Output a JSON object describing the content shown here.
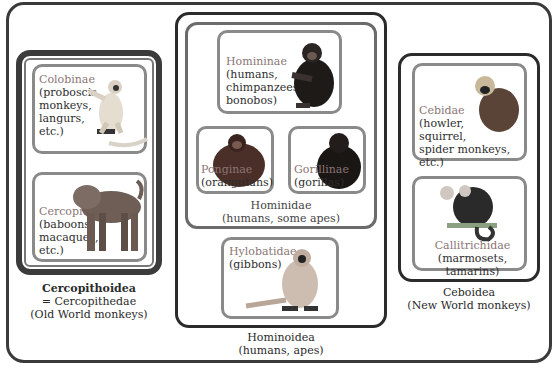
{
  "diagram": {
    "colors": {
      "outer_border": "#3a3a3a",
      "inner_border": "#8a8a8a",
      "taxon_name": "#8a7575",
      "text": "#2e2e2e"
    },
    "groups": [
      {
        "superfamily": "Cercopithoidea",
        "alias": "= Cercopithedae",
        "common": "(Old World monkeys)",
        "families": [
          {
            "name": "Colobinae",
            "lines": [
              "(proboscis",
              "monkeys,",
              "langurs,",
              "etc.)"
            ],
            "icon": "langur-icon"
          },
          {
            "name": "Cercopithecinae",
            "lines": [
              "(baboons,",
              "macaques,",
              "etc.)"
            ],
            "icon": "baboon-icon"
          }
        ]
      },
      {
        "superfamily": "Hominoidea",
        "common": "(humans, apes)",
        "family": {
          "name": "Hominidae",
          "common": "(humans, some apes)",
          "subfamilies": [
            {
              "name": "Homininae",
              "lines": [
                "(humans,",
                "chimpanzees,",
                "bonobos)"
              ],
              "icon": "chimpanzee-icon"
            },
            {
              "name": "Ponginae",
              "lines": [
                "(orangutans)"
              ],
              "icon": "orangutan-icon"
            },
            {
              "name": "Gorillinae",
              "lines": [
                "(gorillas)"
              ],
              "icon": "gorilla-icon"
            }
          ]
        },
        "other_family": {
          "name": "Hylobatidae",
          "lines": [
            "(gibbons)"
          ],
          "icon": "gibbon-icon"
        }
      },
      {
        "superfamily": "Ceboidea",
        "common": "(New World monkeys)",
        "families": [
          {
            "name": "Cebidae",
            "lines": [
              "(howler,",
              "squirrel,",
              "spider monkeys, etc.)"
            ],
            "icon": "squirrel-monkey-icon"
          },
          {
            "name": "Callitrichidae",
            "lines": [
              "(marmosets, tamarins)"
            ],
            "icon": "marmoset-icon"
          }
        ]
      }
    ]
  }
}
